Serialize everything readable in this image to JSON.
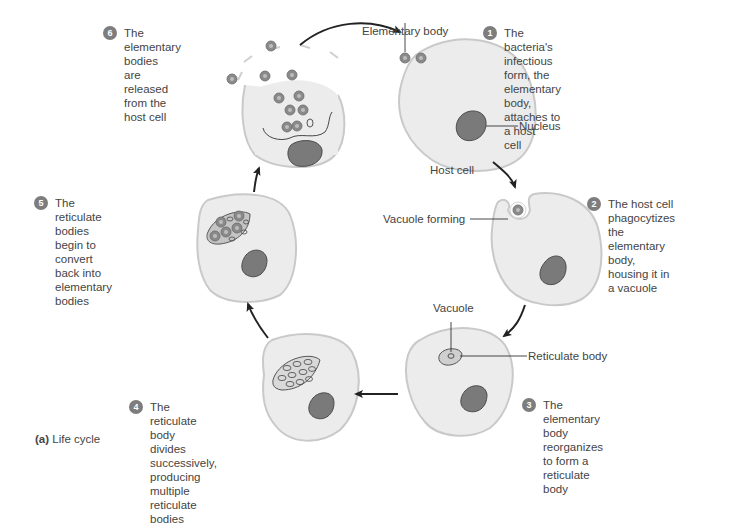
{
  "figure": {
    "caption_prefix": "(a)",
    "caption_text": " Life cycle",
    "colors": {
      "cell_fill": "#ececec",
      "cell_stroke": "#c9c9c9",
      "nucleus_fill": "#7a7a7a",
      "nucleus_stroke": "#4a4a4a",
      "badge": "#7d7d7d",
      "arrow": "#222222",
      "text": "#444444"
    }
  },
  "steps": [
    {
      "num": "1",
      "text": "The bacteria's infectious\nform, the elementary\nbody, attaches to a host\ncell"
    },
    {
      "num": "2",
      "text": "The host cell\nphagocytizes the\nelementary body,\nhousing it in a vacuole"
    },
    {
      "num": "3",
      "text": "The elementary body\nreorganizes to form a\nreticulate body"
    },
    {
      "num": "4",
      "text": "The reticulate body\ndivides successively,\nproducing multiple\nreticulate bodies"
    },
    {
      "num": "5",
      "text": "The reticulate bodies\nbegin to convert back into\nelementary bodies"
    },
    {
      "num": "6",
      "text": "The elementary bodies\nare released from the\nhost cell"
    }
  ],
  "labels": {
    "elementary_body": "Elementary body",
    "nucleus": "Nucleus",
    "host_cell": "Host cell",
    "vacuole_forming": "Vacuole forming",
    "vacuole": "Vacuole",
    "reticulate_body": "Reticulate body"
  }
}
